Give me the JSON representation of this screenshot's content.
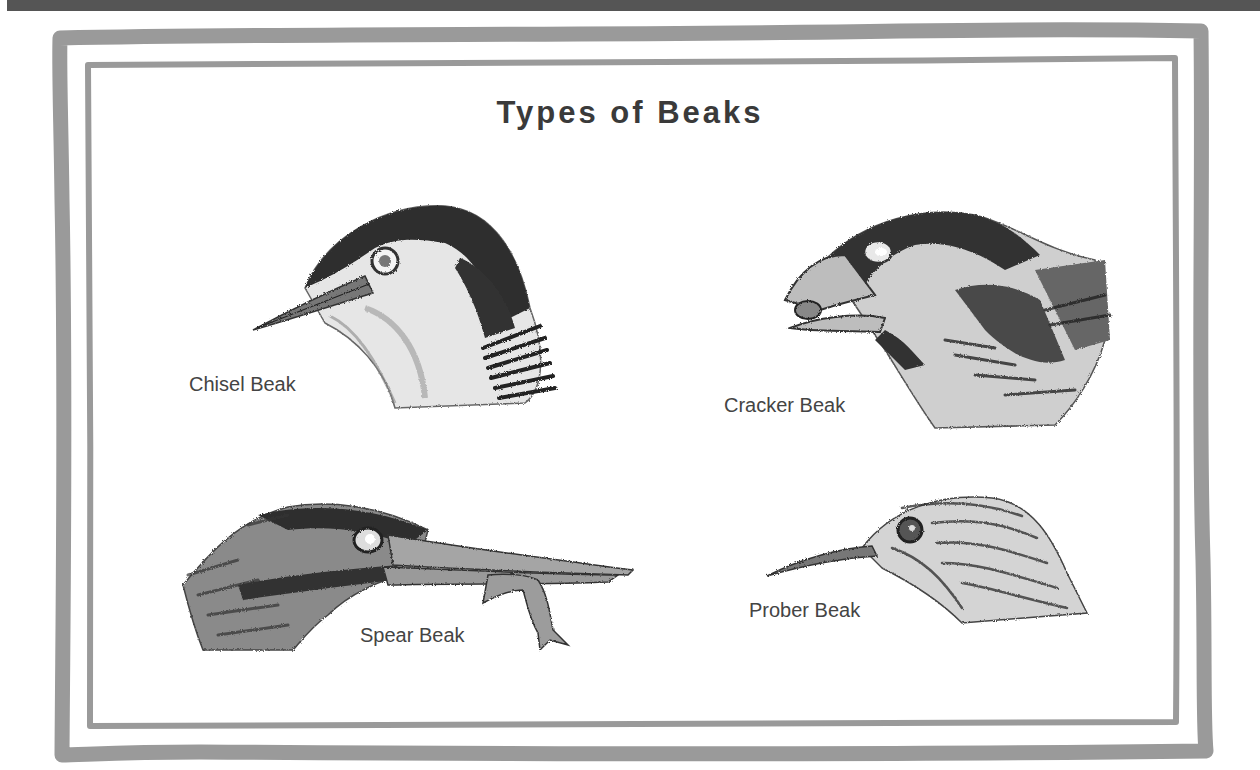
{
  "poster": {
    "title": "Types of Beaks",
    "colors": {
      "frame": "#999999",
      "top_bar": "#555555",
      "text": "#3a3a3a",
      "label": "#444444",
      "background": "#ffffff"
    }
  },
  "birds": [
    {
      "label": "Chisel Beak",
      "icon": "chisel-beak-bird-head"
    },
    {
      "label": "Cracker Beak",
      "icon": "cracker-beak-bird-head"
    },
    {
      "label": "Spear Beak",
      "icon": "spear-beak-bird-head-with-fish"
    },
    {
      "label": "Prober Beak",
      "icon": "prober-beak-bird-head"
    }
  ]
}
